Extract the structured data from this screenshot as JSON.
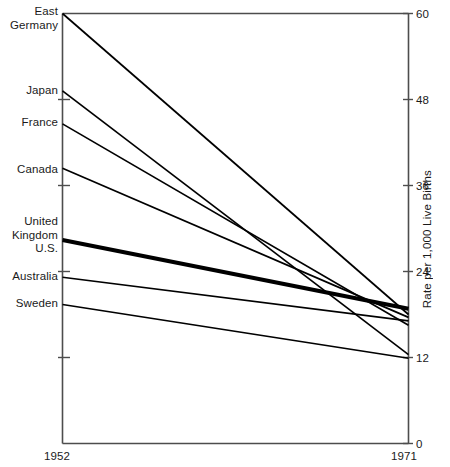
{
  "chart_data": {
    "type": "line",
    "title": "",
    "subtitle": "",
    "xlabel": "",
    "ylabel": "Rate per 1,000 Live Births",
    "x": [
      1952,
      1971
    ],
    "xtick_labels": [
      "1952",
      "1971"
    ],
    "xlim": [
      1952,
      1971
    ],
    "ylim": [
      0,
      60
    ],
    "ytick_values": [
      0,
      12,
      24,
      36,
      48,
      60
    ],
    "ytick_labels": [
      "0",
      "12",
      "24",
      "36",
      "48",
      "60"
    ],
    "grid": false,
    "legend_position": "left-axis-inline",
    "series": [
      {
        "name": "East Germany",
        "label": "East\nGermany",
        "values": [
          60.0,
          18.0
        ],
        "emphasis": false
      },
      {
        "name": "Japan",
        "label": "Japan",
        "values": [
          49.2,
          12.4
        ],
        "emphasis": false
      },
      {
        "name": "France",
        "label": "France",
        "values": [
          44.6,
          16.5
        ],
        "emphasis": false
      },
      {
        "name": "Canada",
        "label": "Canada",
        "values": [
          38.4,
          17.6
        ],
        "emphasis": false
      },
      {
        "name": "United Kingdom / U.S.",
        "label": "United\nKingdom\nU.S.",
        "values": [
          28.4,
          18.8
        ],
        "emphasis": true
      },
      {
        "name": "Australia",
        "label": "Australia",
        "values": [
          23.2,
          17.1
        ],
        "emphasis": false
      },
      {
        "name": "Sweden",
        "label": "Sweden",
        "values": [
          19.4,
          11.9
        ],
        "emphasis": false
      }
    ]
  },
  "axis": {
    "y_title": "Rate per 1,000 Live Births",
    "y_ticks": [
      "60",
      "48",
      "36",
      "24",
      "12",
      "0"
    ],
    "x_start": "1952",
    "x_end": "1971"
  },
  "labels": {
    "east_germany": "East\nGermany",
    "japan": "Japan",
    "france": "France",
    "canada": "Canada",
    "uk_us": "United\nKingdom\nU.S.",
    "australia": "Australia",
    "sweden": "Sweden"
  },
  "colors": {
    "line": "#000000",
    "axis": "#4d4d4d",
    "text": "#1a1a1a",
    "background": "#ffffff"
  }
}
